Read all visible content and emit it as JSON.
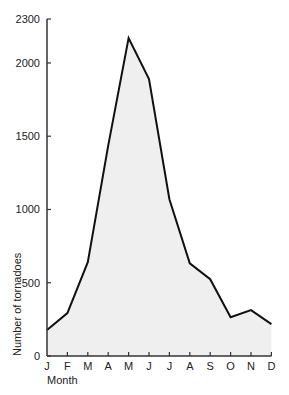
{
  "chart_data": {
    "type": "area",
    "title": "",
    "xlabel": "Month",
    "ylabel": "Number of tornadoes",
    "categories": [
      "J",
      "F",
      "M",
      "A",
      "M",
      "J",
      "J",
      "A",
      "S",
      "O",
      "N",
      "D"
    ],
    "values": [
      177,
      293,
      640,
      1435,
      2170,
      1890,
      1070,
      633,
      524,
      265,
      313,
      218
    ],
    "yticks": [
      0,
      500,
      1000,
      1500,
      2000,
      2300
    ],
    "ylim": [
      0,
      2300
    ],
    "grid": false,
    "legend": null,
    "colors": {
      "line": "#111111",
      "fill": "#efefef",
      "axis": "#333333"
    }
  }
}
